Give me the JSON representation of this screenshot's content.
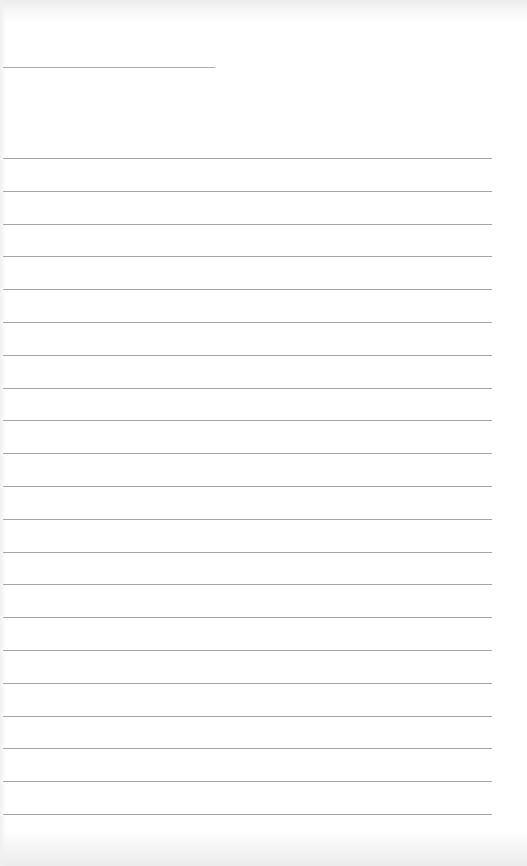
{
  "document": {
    "type": "blank lined paper",
    "header_line": {
      "x": 3,
      "y": 67,
      "width": 212
    },
    "ruled_lines": {
      "count": 21,
      "x": 3,
      "width": 489,
      "first_y": 158,
      "spacing": 32.8
    },
    "line_color": "#a5a5a5",
    "paper_color": "#ffffff",
    "text": []
  }
}
